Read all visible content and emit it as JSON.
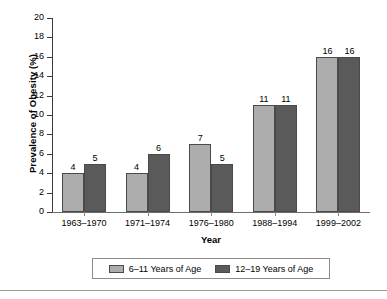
{
  "chart_data": {
    "type": "bar",
    "title": "",
    "xlabel": "Year",
    "ylabel": "Prevalence of Obesity (%)",
    "categories": [
      "1963–1970",
      "1971–1974",
      "1976–1980",
      "1988–1994",
      "1999–2002"
    ],
    "series": [
      {
        "name": "6–11 Years of Age",
        "color": "#adadad",
        "values": [
          4,
          4,
          7,
          11,
          16
        ]
      },
      {
        "name": "12–19 Years of Age",
        "color": "#5a5a5a",
        "values": [
          5,
          6,
          5,
          11,
          16
        ]
      }
    ],
    "ylim": [
      0,
      20
    ],
    "yticks": [
      0,
      2,
      4,
      6,
      8,
      10,
      12,
      14,
      16,
      18,
      20
    ],
    "ytick_labels": [
      "0",
      "2",
      "4",
      "6",
      "8",
      "10",
      "12",
      "14",
      "16",
      "18",
      "20"
    ],
    "grid": false,
    "legend_position": "bottom",
    "data_labels": true
  },
  "legend": {
    "entries": [
      {
        "label": "6–11 Years of Age",
        "swatch": "light-gray-swatch"
      },
      {
        "label": "12–19 Years of Age",
        "swatch": "dark-gray-swatch"
      }
    ]
  },
  "colors": {
    "series_light": "#adadad",
    "series_dark": "#5a5a5a",
    "bar_border": "#4a4a4a",
    "axis": "#3a3a3a",
    "legend_border": "#8c8c8c",
    "rule": "#9a9a9a"
  }
}
